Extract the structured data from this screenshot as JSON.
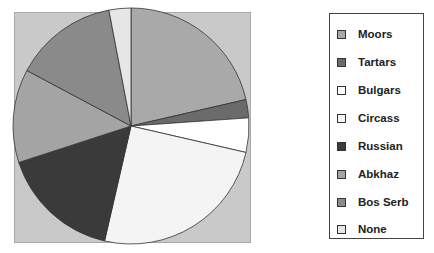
{
  "chart_data": {
    "type": "pie",
    "title": "",
    "categories": [
      "Moors",
      "Tartars",
      "Bulgars",
      "Circass",
      "Russian",
      "Abkhaz",
      "Bos Serb",
      "None"
    ],
    "values": [
      21.4,
      2.5,
      4.7,
      25.0,
      16.4,
      12.8,
      14.2,
      3.0
    ],
    "unit": "percent (estimated from slice angles)",
    "colors": [
      "#a9a9a9",
      "#6b6b6b",
      "#ffffff",
      "#f4f4f4",
      "#3a3a3a",
      "#a4a4a4",
      "#8a8a8a",
      "#e6e6e6"
    ],
    "start_angle_deg": 0,
    "direction": "clockwise",
    "legend_position": "right",
    "plot_background": "#c9c9c9"
  },
  "legend": {
    "items": [
      {
        "label": "Moors",
        "color": "#a9a9a9"
      },
      {
        "label": "Tartars",
        "color": "#6b6b6b"
      },
      {
        "label": "Bulgars",
        "color": "#ffffff"
      },
      {
        "label": "Circass",
        "color": "#f4f4f4"
      },
      {
        "label": "Russian",
        "color": "#3a3a3a"
      },
      {
        "label": "Abkhaz",
        "color": "#a4a4a4"
      },
      {
        "label": "Bos Serb",
        "color": "#8a8a8a"
      },
      {
        "label": "None",
        "color": "#e6e6e6"
      }
    ]
  }
}
